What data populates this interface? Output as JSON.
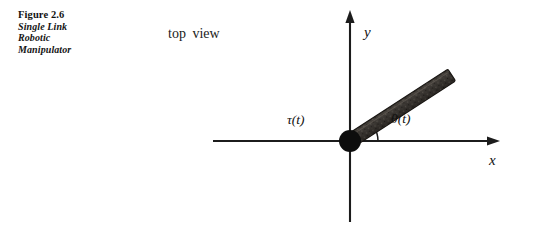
{
  "figure": {
    "caption": {
      "title": "Figure 2.6",
      "lines": [
        "Single Link",
        "Robotic",
        "Manipulator"
      ]
    },
    "view_label": "top  view"
  },
  "diagram": {
    "axes": {
      "y_label": "y",
      "x_label": "x",
      "origin": {
        "x": 350,
        "y": 141
      },
      "y_top": 10,
      "y_bottom": 222,
      "x_left": 213,
      "x_right": 500
    },
    "joint": {
      "name": "revolute-pivot",
      "radius": 11,
      "color": "#0d0d0d"
    },
    "link": {
      "name": "single-rigid-link",
      "tip": {
        "x": 465,
        "y": 65
      },
      "thickness": 13,
      "angle_degrees": 33,
      "fill_color": "#3a3632",
      "edge_color": "#15120f"
    },
    "angle_arc": {
      "radius": 28,
      "from_degrees": 0,
      "to_degrees": 33
    },
    "labels": {
      "torque": "τ(t)",
      "theta": "θ(t)"
    }
  },
  "colors": {
    "background": "#ffffff",
    "ink": "#111111",
    "axis": "#1c1c1c"
  }
}
